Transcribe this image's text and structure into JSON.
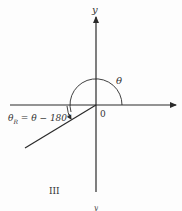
{
  "diagram": {
    "labels": {
      "y_axis_top": "y",
      "y_axis_bottom": "y",
      "theta": "θ",
      "origin": "0",
      "quadrant": "III",
      "reference_angle_lhs": "θ",
      "reference_angle_sub": "R",
      "reference_angle_rhs": " = θ − 180°"
    },
    "colors": {
      "line": "#2a2a2a",
      "text": "#333333",
      "background": "#fdfdfd"
    }
  }
}
